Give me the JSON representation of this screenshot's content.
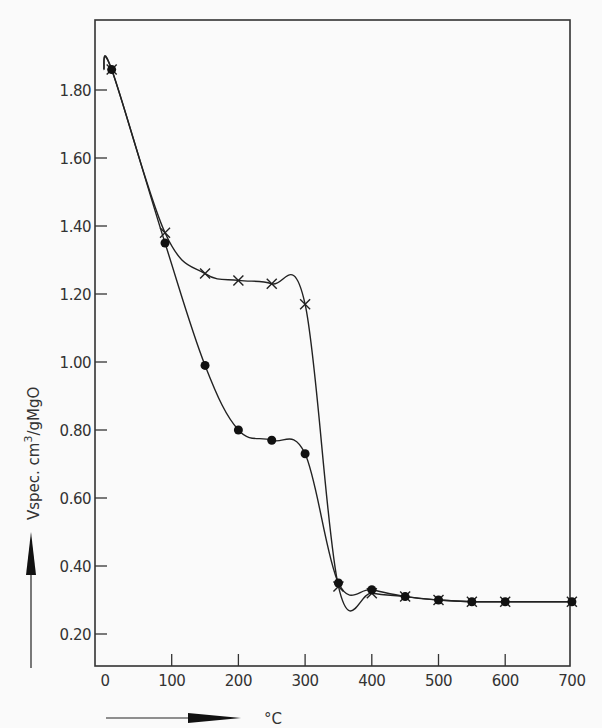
{
  "chart_data": {
    "type": "line",
    "title": "",
    "xlabel": "°C",
    "ylabel": "Vspec. cm³/gMgO",
    "ylabel_parts": {
      "main": "Vspec. cm",
      "sup": "3",
      "unit": "gMgO"
    },
    "xlim": [
      0,
      700
    ],
    "ylim": [
      0.1,
      1.95
    ],
    "x_ticks": [
      0,
      100,
      200,
      300,
      400,
      500,
      600,
      700
    ],
    "x_tick_labels": [
      "0",
      "100",
      "200",
      "300",
      "400",
      "500",
      "600",
      "700"
    ],
    "y_ticks": [
      0.2,
      0.4,
      0.6,
      0.8,
      1.0,
      1.2,
      1.4,
      1.6,
      1.8
    ],
    "y_tick_labels": [
      "0.20",
      "0.40",
      "0.60",
      "0.80",
      "1.00",
      "1.20",
      "1.40",
      "1.60",
      "1.80"
    ],
    "grid": false,
    "legend": null,
    "series": [
      {
        "name": "crosses",
        "marker": "x",
        "x": [
          10,
          90,
          150,
          200,
          250,
          300,
          350,
          400,
          450,
          500,
          550,
          600,
          700
        ],
        "values": [
          1.86,
          1.38,
          1.26,
          1.24,
          1.23,
          1.17,
          0.34,
          0.32,
          0.31,
          0.3,
          0.295,
          0.295,
          0.295
        ]
      },
      {
        "name": "filled circles",
        "marker": "circle",
        "x": [
          10,
          90,
          150,
          200,
          250,
          300,
          350,
          400,
          450,
          500,
          550,
          600,
          700
        ],
        "values": [
          1.86,
          1.35,
          0.99,
          0.8,
          0.77,
          0.73,
          0.35,
          0.33,
          0.31,
          0.3,
          0.295,
          0.295,
          0.295
        ]
      }
    ]
  },
  "annotations": {
    "x_arrow": "right-arrow",
    "y_arrow": "up-arrow",
    "x_unit": "°C"
  }
}
